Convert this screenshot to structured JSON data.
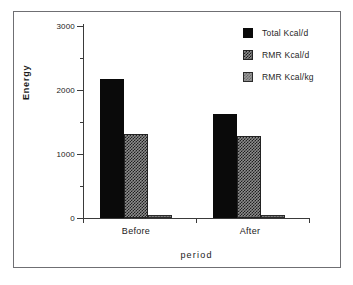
{
  "chart_data": {
    "type": "bar",
    "title": "",
    "xlabel": "period",
    "ylabel": "Energy",
    "categories": [
      "Before",
      "After"
    ],
    "series": [
      {
        "name": "Total Kcal/d",
        "values": [
          2170,
          1620
        ],
        "fill": "solid-black",
        "color": "#0a0a0a"
      },
      {
        "name": "RMR Kcal/d",
        "values": [
          1310,
          1280
        ],
        "fill": "dark-hatch",
        "color": "#8d8d8d"
      },
      {
        "name": "RMR Kcal/kg",
        "values": [
          35,
          30
        ],
        "fill": "light-hatch",
        "color": "#9a9a9a"
      }
    ],
    "ylim": [
      0,
      3000
    ],
    "ytick_major": [
      0,
      1000,
      2000,
      3000
    ],
    "ytick_minor": [
      500,
      1500,
      2500
    ],
    "grid": false,
    "legend_position": "top-right"
  },
  "axis": {
    "y_labels": [
      "3000",
      "2000",
      "1000",
      "0"
    ],
    "title_y": "Energy",
    "title_x": "period",
    "x_labels": [
      "Before",
      "After"
    ]
  },
  "legend": {
    "items": [
      {
        "label": "Total Kcal/d"
      },
      {
        "label": "RMR Kcal/d"
      },
      {
        "label": "RMR Kcal/kg"
      }
    ]
  }
}
